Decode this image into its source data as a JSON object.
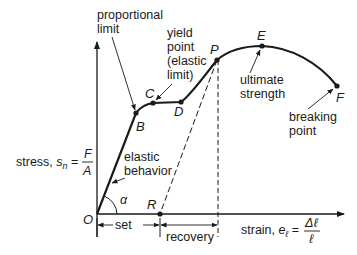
{
  "diagram": {
    "y_axis": {
      "label": "stress, ",
      "symbol": "s",
      "subscript": "n",
      "equals": " = ",
      "numerator": "F",
      "denominator": "A"
    },
    "x_axis": {
      "label": "strain, ",
      "symbol": "e",
      "subscript": "ℓ",
      "equals": " = ",
      "numerator": "Δℓ",
      "denominator": "ℓ"
    },
    "points": {
      "O": "O",
      "B": "B",
      "C": "C",
      "D": "D",
      "P": "P",
      "E": "E",
      "F": "F",
      "R": "R"
    },
    "angle_label": "α",
    "annotations": {
      "proportional_limit": [
        "proportional",
        "limit"
      ],
      "yield_point": [
        "yield",
        "point",
        "(elastic",
        "limit)"
      ],
      "ultimate_strength": [
        "ultimate",
        "strength"
      ],
      "breaking_point": [
        "breaking",
        "point"
      ],
      "elastic_behavior": [
        "elastic",
        "behavior"
      ]
    },
    "dimensions": {
      "set": "set",
      "recovery": "recovery"
    },
    "colors": {
      "line": "#1a1a1a",
      "background": "#ffffff"
    }
  }
}
